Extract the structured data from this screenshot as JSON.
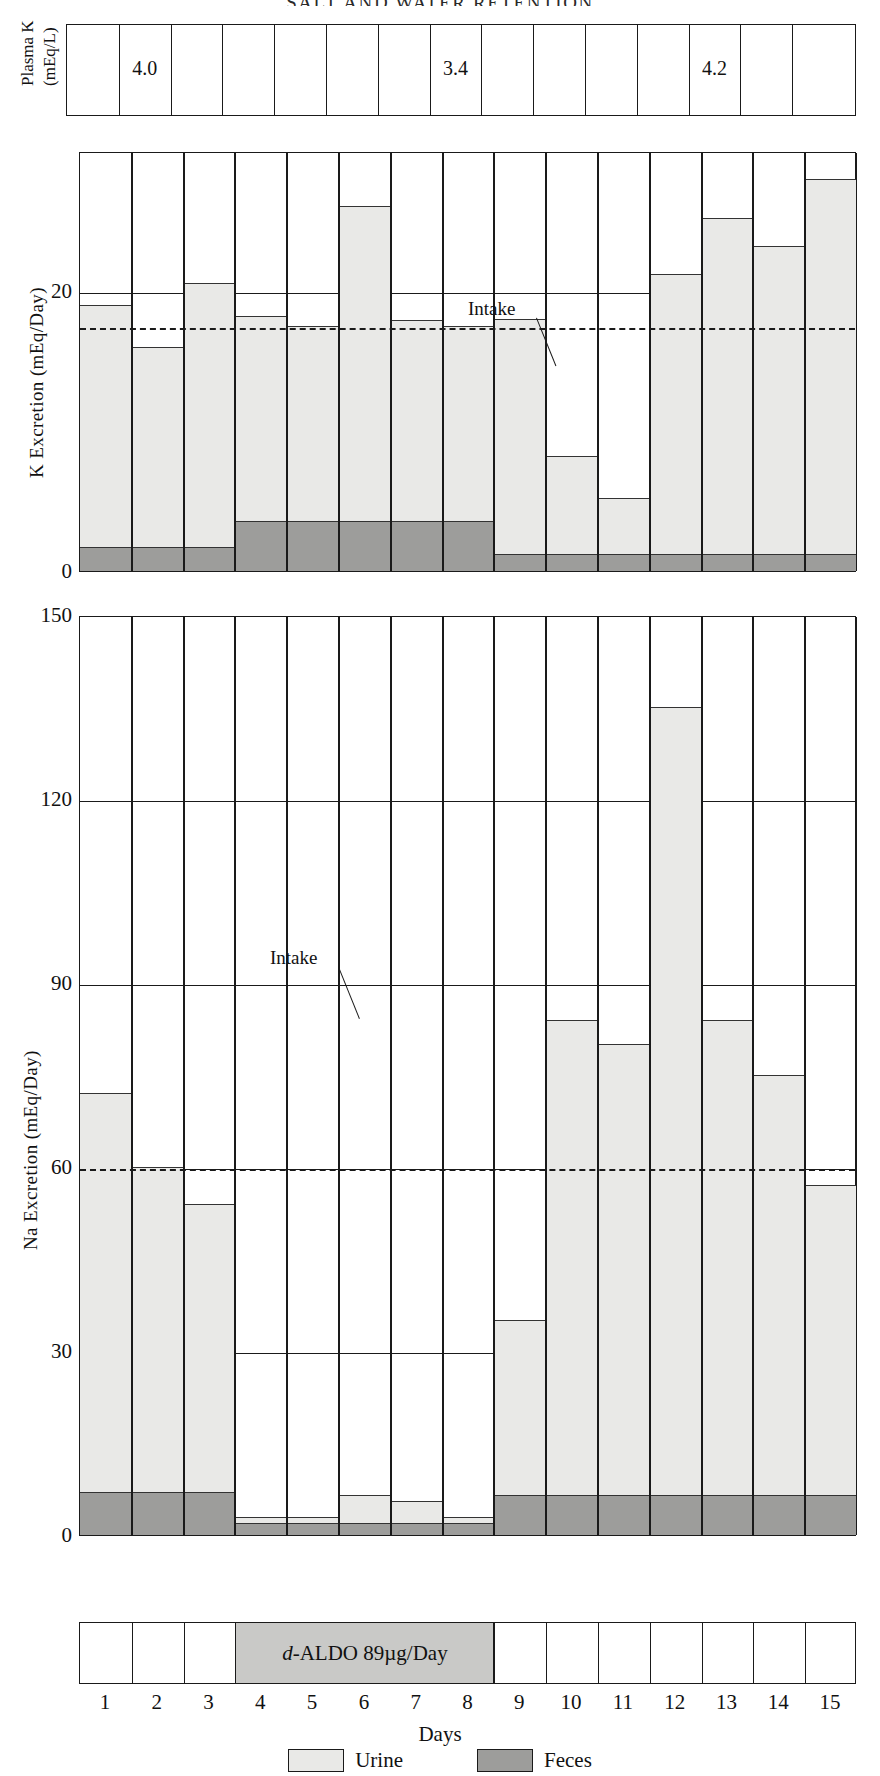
{
  "header": {
    "running_title": "SALT AND WATER RETENTION"
  },
  "plasma": {
    "ylabel_line1": "Plasma K",
    "ylabel_line2": "(mEq/L)",
    "values": [
      {
        "day": 2,
        "value": "4.0"
      },
      {
        "day": 8,
        "value": "3.4"
      },
      {
        "day": 13,
        "value": "4.2"
      }
    ]
  },
  "axis": {
    "days": [
      "1",
      "2",
      "3",
      "4",
      "5",
      "6",
      "7",
      "8",
      "9",
      "10",
      "11",
      "12",
      "13",
      "14",
      "15"
    ],
    "days_title": "Days"
  },
  "treatment": {
    "label_italic": "d",
    "label_rest": "-ALDO 89µg/Day",
    "start_day": 4,
    "end_day": 8
  },
  "legend": [
    {
      "name": "Urine",
      "color": "#e9e9e7"
    },
    {
      "name": "Feces",
      "color": "#9d9d9b"
    }
  ],
  "annotations": {
    "intake_label": "Intake"
  },
  "chart_data": [
    {
      "type": "bar",
      "id": "k-excretion",
      "title": "K Excretion",
      "ylabel": "K Excretion (mEq/Day)",
      "xlabel": "Days",
      "ylim": [
        0,
        30
      ],
      "yticks": [
        "0",
        "20"
      ],
      "ytick_values": [
        0,
        20
      ],
      "grid": true,
      "legend_position": "bottom",
      "categories": [
        "1",
        "2",
        "3",
        "4",
        "5",
        "6",
        "7",
        "8",
        "9",
        "10",
        "11",
        "12",
        "13",
        "14",
        "15"
      ],
      "series": [
        {
          "name": "Feces",
          "color": "#9d9d9b",
          "values": [
            1.7,
            1.7,
            1.7,
            3.6,
            3.6,
            3.6,
            3.6,
            3.6,
            1.2,
            1.2,
            1.2,
            1.2,
            1.2,
            1.2,
            1.2
          ]
        },
        {
          "name": "Urine",
          "color": "#e9e9e7",
          "values": [
            17.3,
            14.3,
            18.9,
            14.6,
            13.9,
            22.5,
            14.3,
            13.9,
            16.8,
            7.0,
            4.0,
            20.0,
            24.0,
            22.0,
            26.8
          ]
        }
      ],
      "totals": [
        19.0,
        16.0,
        20.6,
        18.2,
        17.5,
        26.1,
        17.9,
        17.5,
        18.0,
        8.2,
        5.2,
        21.2,
        25.2,
        23.2,
        28.0
      ],
      "intake_line": {
        "label": "Intake",
        "value": 17.5,
        "style": "dashed"
      }
    },
    {
      "type": "bar",
      "id": "na-excretion",
      "title": "Na Excretion",
      "ylabel": "Na Excretion (mEq/Day)",
      "xlabel": "Days",
      "ylim": [
        0,
        150
      ],
      "yticks": [
        "0",
        "30",
        "60",
        "90",
        "120",
        "150"
      ],
      "ytick_values": [
        0,
        30,
        60,
        90,
        120,
        150
      ],
      "grid": true,
      "legend_position": "bottom",
      "categories": [
        "1",
        "2",
        "3",
        "4",
        "5",
        "6",
        "7",
        "8",
        "9",
        "10",
        "11",
        "12",
        "13",
        "14",
        "15"
      ],
      "series": [
        {
          "name": "Feces",
          "color": "#9d9d9b",
          "values": [
            7.0,
            7.0,
            7.0,
            2.0,
            2.0,
            2.0,
            2.0,
            2.0,
            6.5,
            6.5,
            6.5,
            6.5,
            6.5,
            6.5,
            6.5
          ]
        },
        {
          "name": "Urine",
          "color": "#e9e9e7",
          "values": [
            65.0,
            53.0,
            47.0,
            1.0,
            1.0,
            4.5,
            3.5,
            1.0,
            28.5,
            77.5,
            73.5,
            128.5,
            77.5,
            68.5,
            50.5
          ]
        }
      ],
      "totals": [
        72.0,
        60.0,
        54.0,
        3.0,
        3.0,
        6.5,
        5.5,
        3.0,
        35.0,
        84.0,
        80.0,
        135.0,
        84.0,
        75.0,
        57.0
      ],
      "intake_line": {
        "label": "Intake",
        "value": 60,
        "style": "dashed"
      }
    }
  ]
}
